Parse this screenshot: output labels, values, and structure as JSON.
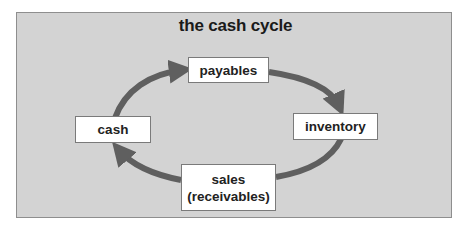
{
  "diagram": {
    "title": "the cash cycle",
    "colors": {
      "background": "#d3d3d3",
      "arrow": "#5f5f5f",
      "node_fill": "#ffffff",
      "node_border": "#7a7a7a",
      "text": "#222222"
    },
    "nodes": [
      {
        "id": "payables",
        "label": "payables"
      },
      {
        "id": "inventory",
        "label": "inventory"
      },
      {
        "id": "sales",
        "label_line1": "sales",
        "label_line2": "(receivables)"
      },
      {
        "id": "cash",
        "label": "cash"
      }
    ],
    "edges": [
      {
        "from": "cash",
        "to": "payables"
      },
      {
        "from": "payables",
        "to": "inventory"
      },
      {
        "from": "inventory",
        "to": "sales"
      },
      {
        "from": "sales",
        "to": "cash"
      }
    ]
  }
}
